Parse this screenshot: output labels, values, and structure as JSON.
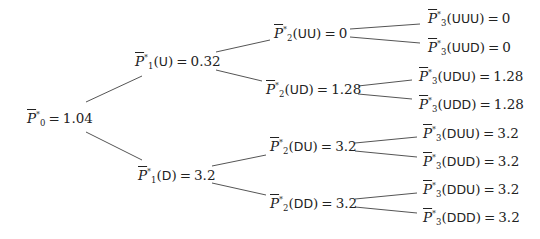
{
  "diagram": {
    "type": "binomial-tree",
    "symbol": "P",
    "superscript": "*",
    "nodes": {
      "root": {
        "sub": "0",
        "path": "",
        "value": "1.04"
      },
      "U": {
        "sub": "1",
        "path": "U",
        "value": "0.32"
      },
      "D": {
        "sub": "1",
        "path": "D",
        "value": "3.2"
      },
      "UU": {
        "sub": "2",
        "path": "UU",
        "value": "0"
      },
      "UD": {
        "sub": "2",
        "path": "UD",
        "value": "1.28"
      },
      "DU": {
        "sub": "2",
        "path": "DU",
        "value": "3.2"
      },
      "DD": {
        "sub": "2",
        "path": "DD",
        "value": "3.2"
      },
      "UUU": {
        "sub": "3",
        "path": "UUU",
        "value": "0"
      },
      "UUD": {
        "sub": "3",
        "path": "UUD",
        "value": "0"
      },
      "UDU": {
        "sub": "3",
        "path": "UDU",
        "value": "1.28"
      },
      "UDD": {
        "sub": "3",
        "path": "UDD",
        "value": "1.28"
      },
      "DUU": {
        "sub": "3",
        "path": "DUU",
        "value": "3.2"
      },
      "DUD": {
        "sub": "3",
        "path": "DUD",
        "value": "3.2"
      },
      "DDU": {
        "sub": "3",
        "path": "DDU",
        "value": "3.2"
      },
      "DDD": {
        "sub": "3",
        "path": "DDD",
        "value": "3.2"
      }
    },
    "labels": {
      "open_paren": "(",
      "close_paren": ")",
      "equals": "="
    },
    "edge_color": "#555555"
  }
}
